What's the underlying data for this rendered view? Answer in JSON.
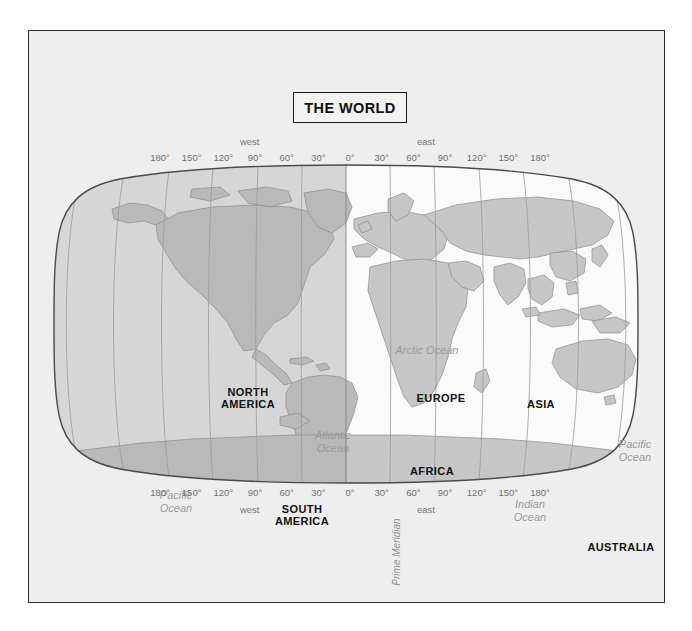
{
  "page": {
    "background_color": "#ffffff",
    "panel_color": "#eeeeee",
    "frame_color": "#2b2b2b"
  },
  "title": {
    "text": "THE WORLD"
  },
  "colors": {
    "land_west": "#b9b9b9",
    "land_east": "#c6c6c6",
    "ocean_west": "#d6d6d6",
    "ocean_east": "#fafafa",
    "graticule": "#9b9b9b",
    "outline": "#4a4a4a",
    "continent_label": "#111111",
    "ocean_label": "#9a9a9a",
    "scale_label": "#6f6f6f"
  },
  "longitude_scale": {
    "ticks": [
      {
        "label": "180°",
        "lon": -180
      },
      {
        "label": "150°",
        "lon": -150
      },
      {
        "label": "120°",
        "lon": -120
      },
      {
        "label": "90°",
        "lon": -90
      },
      {
        "label": "60°",
        "lon": -60
      },
      {
        "label": "30°",
        "lon": -30
      },
      {
        "label": "0°",
        "lon": 0
      },
      {
        "label": "30°",
        "lon": 30
      },
      {
        "label": "60°",
        "lon": 60
      },
      {
        "label": "90°",
        "lon": 90
      },
      {
        "label": "120°",
        "lon": 120
      },
      {
        "label": "150°",
        "lon": 150
      },
      {
        "label": "180°",
        "lon": 180
      }
    ],
    "hemispheres": [
      {
        "label": "west",
        "lon": -95
      },
      {
        "label": "east",
        "lon": 72
      }
    ]
  },
  "continents": [
    {
      "name": "NORTH AMERICA",
      "lines": [
        "NORTH",
        "AMERICA"
      ],
      "x": 196,
      "y": 235
    },
    {
      "name": "SOUTH AMERICA",
      "lines": [
        "SOUTH",
        "AMERICA"
      ],
      "x": 250,
      "y": 352
    },
    {
      "name": "EUROPE",
      "lines": [
        "EUROPE"
      ],
      "x": 389,
      "y": 235
    },
    {
      "name": "AFRICA",
      "lines": [
        "AFRICA"
      ],
      "x": 380,
      "y": 308
    },
    {
      "name": "ASIA",
      "lines": [
        "ASIA"
      ],
      "x": 489,
      "y": 241
    },
    {
      "name": "AUSTRALIA",
      "lines": [
        "AUSTRALIA"
      ],
      "x": 569,
      "y": 384
    },
    {
      "name": "ANTARCTICA",
      "lines": [
        "ANTARCTICA"
      ],
      "x": 397,
      "y": 475
    }
  ],
  "oceans": [
    {
      "name": "Pacific Ocean West",
      "lines": [
        "Pacific",
        "Ocean"
      ],
      "x": 124,
      "y": 339
    },
    {
      "name": "Atlantic Ocean",
      "lines": [
        "Atlantic",
        "Ocean"
      ],
      "x": 281,
      "y": 279
    },
    {
      "name": "Arctic Ocean",
      "lines": [
        "Arctic Ocean"
      ],
      "x": 375,
      "y": 187
    },
    {
      "name": "Indian Ocean",
      "lines": [
        "Indian",
        "Ocean"
      ],
      "x": 478,
      "y": 348
    },
    {
      "name": "Pacific Ocean East",
      "lines": [
        "Pacific",
        "Ocean"
      ],
      "x": 583,
      "y": 288
    }
  ],
  "prime_meridian": {
    "label": "Prime Meridian",
    "x": 344,
    "y": 389
  }
}
